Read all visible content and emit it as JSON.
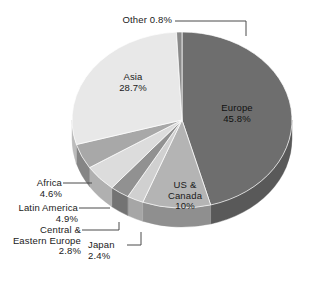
{
  "chart_data": {
    "type": "pie",
    "title": "",
    "subtitle": "",
    "xlabel": "",
    "ylabel": "",
    "legend_position": "none",
    "grid": false,
    "style": "3d-pie-grayscale",
    "background": "#ffffff",
    "start_angle_deg": 0,
    "direction": "clockwise",
    "categories": [
      "Europe",
      "US & Canada",
      "Japan",
      "Central & Eastern Europe",
      "Latin America",
      "Africa",
      "Asia",
      "Other"
    ],
    "values": [
      45.8,
      10.0,
      2.4,
      2.8,
      4.9,
      4.6,
      28.7,
      0.8
    ],
    "unit": "%",
    "slices": [
      {
        "label": "Europe",
        "value": 45.8,
        "value_text": "45.8%",
        "color": "#6e6e6e",
        "side_color": "#595959",
        "label_place": "inside"
      },
      {
        "label": "US & Canada",
        "value": 10.0,
        "value_text": "10%",
        "color": "#b4b4b4",
        "side_color": "#8f8f8f",
        "label_place": "inside"
      },
      {
        "label": "Japan",
        "value": 2.4,
        "value_text": "2.4%",
        "color": "#d0d0d0",
        "side_color": "#a6a6a6",
        "label_place": "callout"
      },
      {
        "label": "Central & Eastern Europe",
        "value": 2.8,
        "value_text": "2.8%",
        "color": "#919191",
        "side_color": "#737373",
        "label_place": "callout"
      },
      {
        "label": "Latin America",
        "value": 4.9,
        "value_text": "4.9%",
        "color": "#dcdcdc",
        "side_color": "#b0b0b0",
        "label_place": "callout"
      },
      {
        "label": "Africa",
        "value": 4.6,
        "value_text": "4.6%",
        "color": "#a8a8a8",
        "side_color": "#858585",
        "label_place": "callout"
      },
      {
        "label": "Asia",
        "value": 28.7,
        "value_text": "28.7%",
        "color": "#e8e8e8",
        "side_color": "#bcbcbc",
        "label_place": "inside"
      },
      {
        "label": "Other",
        "value": 0.8,
        "value_text": "0.8%",
        "color": "#8a8a8a",
        "side_color": "#6e6e6e",
        "label_place": "callout"
      }
    ]
  },
  "labels": {
    "other_name": "Other",
    "other_value": "0.8%",
    "other_combined": "Other 0.8%",
    "asia_name": "Asia",
    "asia_value": "28.7%",
    "europe_name": "Europe",
    "europe_value": "45.8%",
    "us_canada_line1": "US &",
    "us_canada_line2": "Canada",
    "us_canada_value": "10%",
    "africa_name": "Africa",
    "africa_value": "4.6%",
    "latin_america_name": "Latin America",
    "latin_america_value": "4.9%",
    "cee_line1": "Central &",
    "cee_line2": "Eastern Europe",
    "cee_value": "2.8%",
    "japan_name": "Japan",
    "japan_value": "2.4%"
  },
  "colors": {
    "background": "#ffffff",
    "text": "#1a1a1a",
    "leader_line": "#4a4a4a",
    "europe": "#6e6e6e",
    "us_canada": "#b4b4b4",
    "japan": "#d0d0d0",
    "central_eastern_europe": "#919191",
    "latin_america": "#dcdcdc",
    "africa": "#a8a8a8",
    "asia": "#e8e8e8",
    "other": "#8a8a8a"
  }
}
